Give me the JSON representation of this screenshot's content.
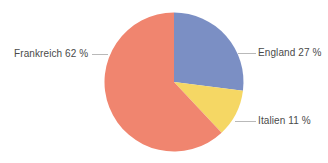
{
  "chart_data": {
    "type": "pie",
    "title": "",
    "categories": [
      "England",
      "Italien",
      "Frankreich"
    ],
    "values": [
      27,
      11,
      62
    ],
    "unit": "%",
    "labels": [
      "England 27 %",
      "Italien 11 %",
      "Frankreich 62 %"
    ],
    "colors": [
      "#7b8fc4",
      "#f5d764",
      "#f0856f"
    ],
    "legend": "none",
    "grid": false,
    "start_angle_deg": 0,
    "direction": "clockwise",
    "slices": [
      {
        "name": "England",
        "value": 27,
        "label": "England 27 %",
        "color": "#7b8fc4",
        "start_deg": 0,
        "end_deg": 97.2
      },
      {
        "name": "Italien",
        "value": 11,
        "label": "Italien 11 %",
        "color": "#f5d764",
        "start_deg": 97.2,
        "end_deg": 136.8
      },
      {
        "name": "Frankreich",
        "value": 62,
        "label": "Frankreich 62 %",
        "color": "#f0856f",
        "start_deg": 136.8,
        "end_deg": 360
      }
    ]
  },
  "labels": {
    "frankreich": "Frankreich 62 %",
    "england": "England 27 %",
    "italien": "Italien 11 %"
  },
  "style": {
    "background": "#ffffff",
    "text_color": "#4a4a4a",
    "leader_line_color": "#b9b9b9",
    "color_england": "#7b8fc4",
    "color_italien": "#f5d764",
    "color_frankreich": "#f0856f"
  }
}
